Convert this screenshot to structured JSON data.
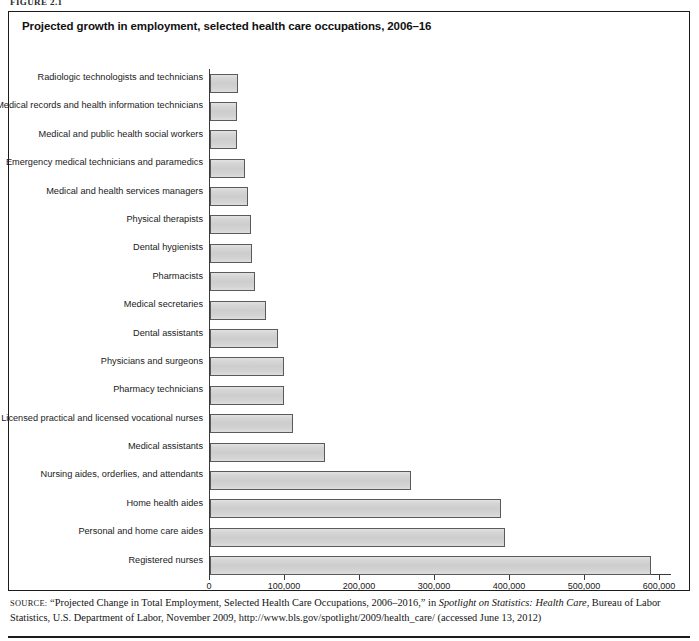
{
  "figure": {
    "label": "FIGURE 2.1"
  },
  "chart_data": {
    "type": "bar",
    "orientation": "horizontal",
    "title": "Projected growth in employment, selected health care occupations, 2006–16",
    "xlabel": "",
    "ylabel": "",
    "xlim": [
      0,
      600000
    ],
    "grid": false,
    "legend": "none",
    "categories": [
      "Radiologic technologists and technicians",
      "Medical records and health information technicians",
      "Medical and public health social workers",
      "Emergency medical technicians and paramedics",
      "Medical and health services managers",
      "Physical therapists",
      "Dental hygienists",
      "Pharmacists",
      "Medical secretaries",
      "Dental assistants",
      "Physicians and surgeons",
      "Pharmacy technicians",
      "Licensed practical and licensed vocational nurses",
      "Medical assistants",
      "Nursing aides, orderlies, and attendants",
      "Home health aides",
      "Personal and home care aides",
      "Registered nurses"
    ],
    "values": [
      37000,
      36000,
      36000,
      46000,
      50000,
      55000,
      56000,
      60000,
      74000,
      91000,
      99000,
      99000,
      111000,
      153000,
      268000,
      388000,
      393000,
      588000
    ],
    "xticks": [
      0,
      100000,
      200000,
      300000,
      400000,
      500000,
      600000
    ],
    "xticklabels": [
      "0",
      "100,000",
      "200,000",
      "300,000",
      "400,000",
      "500,000",
      "600,000"
    ],
    "bar_fill": "#d2d2d2",
    "bar_border": "#5a5a5a"
  },
  "source": {
    "word": "SOURCE:",
    "line1_a": " “Projected Change in Total Employment, Selected Health Care Occupations, 2006–2016,” in ",
    "line1_italic": "Spotlight on Statistics: Health Care",
    "line1_b": ", Bureau of Labor Statistics, U.S. Department of Labor, November 2009, http://www.bls.gov/spotlight/2009/health_care/ (accessed June 13, 2012)"
  }
}
